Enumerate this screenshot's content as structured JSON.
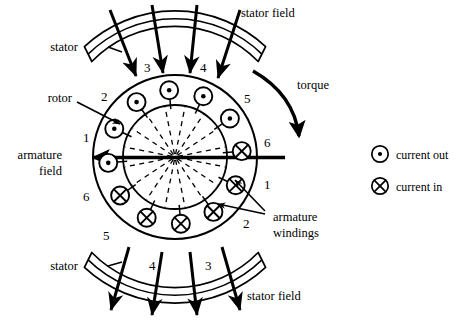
{
  "diagram": {
    "center": {
      "x": 175,
      "y": 157
    },
    "geometry": {
      "rotor_outer_radius": 82,
      "rotor_inner_radius": 52,
      "winding_ring_radius": 67,
      "winding_symbol_radius": 9,
      "spoke_count": 16,
      "stator_inner_radius": 98,
      "stator_outer_radius": 116
    },
    "colors": {
      "stroke": "#000000",
      "background": "#ffffff",
      "dashed": "#000000"
    },
    "labels": {
      "stator_top": "stator",
      "stator_bottom": "stator",
      "stator_field_top": "stator field",
      "stator_field_bottom": "stator field",
      "rotor": "rotor",
      "torque": "torque",
      "armature_field_line1": "armature",
      "armature_field_line2": "field",
      "armature_windings_line1": "armature",
      "armature_windings_line2": "windings"
    },
    "legend": {
      "items": [
        {
          "symbol": "current-out-icon",
          "label": "current out",
          "glyph": "dot"
        },
        {
          "symbol": "current-in-icon",
          "label": "current in",
          "glyph": "cross"
        }
      ]
    },
    "pole_numbers_top_arc": [
      "3",
      "4"
    ],
    "pole_numbers_bottom_arc": [
      "4",
      "3"
    ],
    "winding_numbers": {
      "upper_left": [
        "2",
        "1"
      ],
      "upper_right": [
        "5",
        "6"
      ],
      "lower_left": [
        "6",
        "5"
      ],
      "lower_right": [
        "1",
        "2"
      ]
    },
    "windings": [
      {
        "index": 1,
        "number": "2",
        "angle_deg": 115,
        "current": "in",
        "glyph": "cross"
      },
      {
        "index": 2,
        "number": "3",
        "angle_deg": 145,
        "current": "in",
        "glyph": "cross"
      },
      {
        "index": 3,
        "number": "4",
        "angle_deg": 175,
        "current": "in",
        "glyph": "cross"
      },
      {
        "index": 4,
        "number": "5",
        "angle_deg": 205,
        "current": "in",
        "glyph": "cross"
      },
      {
        "index": 5,
        "number": "6",
        "angle_deg": 235,
        "current": "in",
        "glyph": "cross"
      },
      {
        "index": 6,
        "number": "1",
        "angle_deg": 85,
        "current": "in",
        "glyph": "cross"
      },
      {
        "index": 7,
        "number": "1",
        "angle_deg": 295,
        "current": "out",
        "glyph": "dot"
      },
      {
        "index": 8,
        "number": "2",
        "angle_deg": 325,
        "current": "out",
        "glyph": "dot"
      },
      {
        "index": 9,
        "number": "3",
        "angle_deg": 355,
        "current": "out",
        "glyph": "dot"
      },
      {
        "index": 10,
        "number": "4",
        "angle_deg": 25,
        "current": "out",
        "glyph": "dot"
      },
      {
        "index": 11,
        "number": "5",
        "angle_deg": 55,
        "current": "out",
        "glyph": "dot"
      },
      {
        "index": 12,
        "number": "6",
        "angle_deg": 265,
        "current": "out",
        "glyph": "dot"
      }
    ],
    "field_arrows": {
      "top_count": 4,
      "bottom_count": 4,
      "direction": "downward"
    }
  }
}
